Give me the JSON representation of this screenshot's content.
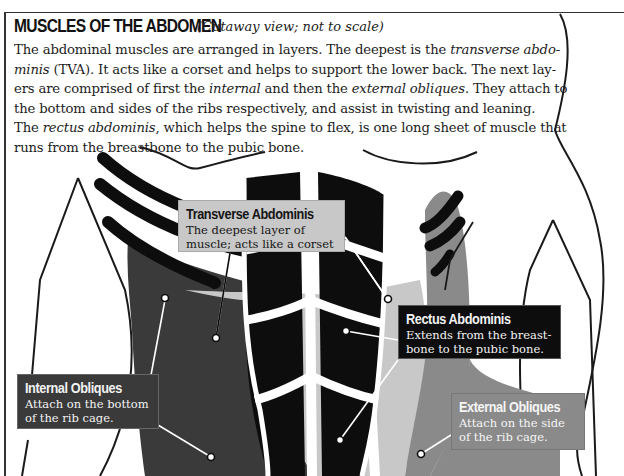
{
  "header": {
    "title": "MUSCLES OF THE ABDOMEN",
    "subtitle": "(Cutaway view; not to scale)"
  },
  "intro": {
    "line1_a": "The abdominal muscles are arranged in layers. The deepest is the ",
    "line1_em": "transverse abdo-",
    "line2_em": "minis",
    "line2_b": " (TVA). It acts like a corset and helps to support the lower back. The next lay-",
    "line3_a": "ers are comprised of first the ",
    "line3_em1": "internal",
    "line3_b": " and then the ",
    "line3_em2": "external obliques",
    "line3_c": ". They attach to",
    "line4": "the bottom and sides of the ribs respectively, and assist in twisting and leaning.",
    "line5_a": "The ",
    "line5_em": "rectus abdominis",
    "line5_b": ", which helps the spine to flex, is one long sheet of muscle that",
    "line6": "runs from the breastbone to the pubic bone."
  },
  "labels": {
    "transverse": {
      "title": "Transverse Abdominis",
      "desc1": "The deepest layer of",
      "desc2": "muscle; acts like a corset"
    },
    "rectus": {
      "title": "Rectus Abdominis",
      "desc1": "Extends from the breast-",
      "desc2": "bone to the pubic bone."
    },
    "internal": {
      "title": "Internal Obliques",
      "desc1": "Attach on the bottom",
      "desc2": "of the rib cage."
    },
    "external": {
      "title": "External Obliques",
      "desc1": "Attach on the side",
      "desc2": "of the rib cage."
    }
  },
  "colors": {
    "rectus": "#0d0d0d",
    "internal_obliques": "#3a3a3a",
    "transverse": "#c8c8c8",
    "external_obliques": "#8a8a8a",
    "outline": "#1a1a1a"
  }
}
